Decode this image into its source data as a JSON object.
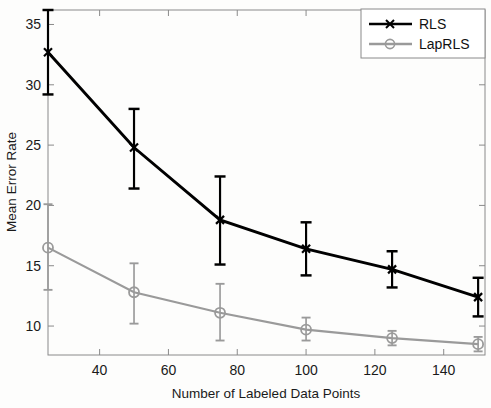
{
  "chart_data": {
    "type": "line",
    "title": "",
    "xlabel": "Number of Labeled Data Points",
    "ylabel": "Mean Error Rate",
    "xlim": [
      25,
      152
    ],
    "ylim": [
      7.6,
      36.2
    ],
    "xticks": [
      40,
      60,
      80,
      100,
      120,
      140
    ],
    "yticks": [
      10,
      15,
      20,
      25,
      30,
      35
    ],
    "xtick_labels": [
      "40",
      "60",
      "80",
      "100",
      "120",
      "140"
    ],
    "ytick_labels": [
      "10",
      "15",
      "20",
      "25",
      "30",
      "35"
    ],
    "grid": false,
    "legend_position": "top-right",
    "x": [
      25,
      50,
      75,
      100,
      125,
      150
    ],
    "series": [
      {
        "name": "RLS",
        "color": "#000000",
        "marker": "x",
        "values": [
          32.7,
          24.8,
          18.8,
          16.4,
          14.7,
          12.4
        ],
        "err_low": [
          29.2,
          21.4,
          15.1,
          14.2,
          13.2,
          10.8
        ],
        "err_high": [
          36.2,
          28.0,
          22.4,
          18.6,
          16.2,
          14.0
        ]
      },
      {
        "name": "LapRLS",
        "color": "#9a9a9a",
        "marker": "o",
        "values": [
          16.5,
          12.8,
          11.1,
          9.7,
          9.0,
          8.5
        ],
        "err_low": [
          13.0,
          10.2,
          8.8,
          8.8,
          8.4,
          7.9
        ],
        "err_high": [
          20.1,
          15.2,
          13.5,
          10.7,
          9.6,
          9.1
        ]
      }
    ]
  },
  "legend": {
    "entries": [
      {
        "label": "RLS"
      },
      {
        "label": "LapRLS"
      }
    ]
  },
  "axes": {
    "xlabel": "Number of Labeled Data Points",
    "ylabel": "Mean Error Rate",
    "xticks": [
      "40",
      "60",
      "80",
      "100",
      "120",
      "140"
    ],
    "yticks": [
      "10",
      "15",
      "20",
      "25",
      "30",
      "35"
    ]
  },
  "colors": {
    "series_rls": "#000000",
    "series_laprls": "#9a9a9a",
    "axis": "#7d7d7d",
    "background": "#fdfdfc",
    "text": "#1a1a1a"
  }
}
